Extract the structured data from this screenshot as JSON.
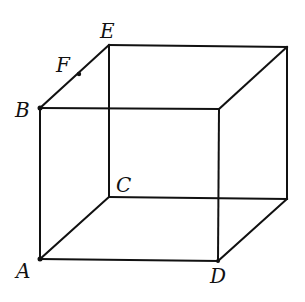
{
  "diagram": {
    "type": "cube-wireframe",
    "labels": {
      "A": "A",
      "B": "B",
      "C": "C",
      "D": "D",
      "E": "E",
      "F": "F"
    },
    "vertices": {
      "A": [
        40,
        259
      ],
      "B": [
        40,
        108
      ],
      "C": [
        109,
        197
      ],
      "D": [
        218,
        261
      ],
      "E": [
        109,
        45
      ],
      "F": [
        79,
        74
      ],
      "front_top_right": [
        219,
        109
      ],
      "back_top_right": [
        287,
        47
      ],
      "back_bottom_right": [
        287,
        199
      ]
    },
    "colors": {
      "line": "#111111",
      "background": "#ffffff"
    }
  }
}
